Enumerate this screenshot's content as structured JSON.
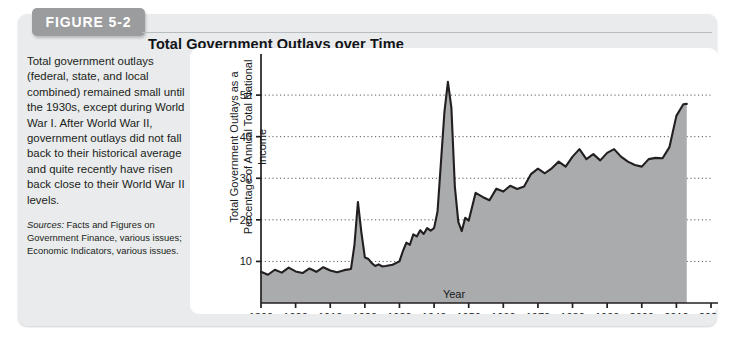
{
  "figure": {
    "tab_label": "FIGURE 5-2",
    "title": "Total Government Outlays over Time",
    "caption": "Total government outlays (federal, state, and local combined) remained small until the 1930s, except during World War I. After World War II, government outlays did not fall back to their historical average and quite recently have risen back close to their World War II levels.",
    "sources_label": "Sources:",
    "sources_text": " Facts and Figures on Government Finance, various issues; Economic Indicators, various issues."
  },
  "colors": {
    "card_background": "#e9ebec",
    "tab_background": "#9a9c9e",
    "panel_background": "#ffffff",
    "area_fill": "#a9abad",
    "line": "#231f20",
    "gridline": "#555759",
    "axis": "#231f20"
  },
  "chart_data": {
    "type": "area",
    "title": "Total Government Outlays over Time",
    "xlabel": "Year",
    "ylabel": "Total Government Outlays as a Percentage of Annual Total National Income",
    "xlim": [
      1890,
      2020
    ],
    "ylim": [
      0,
      57
    ],
    "xticks": [
      1890,
      1900,
      1910,
      1920,
      1930,
      1940,
      1950,
      1960,
      1970,
      1980,
      1990,
      2000,
      2010,
      2020
    ],
    "yticks": [
      10,
      20,
      30,
      40,
      50
    ],
    "grid": "horizontal-dotted",
    "legend": "none",
    "x": [
      1890,
      1892,
      1894,
      1896,
      1898,
      1900,
      1902,
      1904,
      1906,
      1908,
      1910,
      1912,
      1914,
      1916,
      1917,
      1918,
      1919,
      1920,
      1921,
      1922,
      1923,
      1924,
      1925,
      1926,
      1928,
      1930,
      1931,
      1932,
      1933,
      1934,
      1935,
      1936,
      1937,
      1938,
      1939,
      1940,
      1941,
      1942,
      1943,
      1944,
      1945,
      1946,
      1947,
      1948,
      1949,
      1950,
      1952,
      1954,
      1956,
      1958,
      1960,
      1962,
      1964,
      1966,
      1968,
      1970,
      1972,
      1974,
      1976,
      1978,
      1980,
      1982,
      1984,
      1986,
      1988,
      1990,
      1992,
      1994,
      1996,
      1998,
      2000,
      2002,
      2004,
      2006,
      2008,
      2010,
      2012,
      2013
    ],
    "values": [
      7.5,
      6.8,
      8.0,
      7.3,
      8.5,
      7.6,
      7.2,
      8.3,
      7.5,
      8.6,
      7.8,
      7.4,
      7.9,
      8.2,
      14.0,
      24.3,
      17.0,
      11.0,
      10.6,
      9.6,
      8.9,
      9.3,
      8.8,
      8.9,
      9.2,
      10.0,
      12.5,
      14.5,
      14.0,
      16.5,
      16.0,
      17.5,
      16.6,
      18.0,
      17.4,
      18.0,
      22.0,
      34.0,
      46.0,
      53.2,
      47.0,
      28.0,
      19.5,
      17.3,
      20.5,
      19.8,
      26.5,
      25.5,
      24.7,
      27.5,
      26.8,
      28.2,
      27.4,
      28.0,
      31.0,
      32.3,
      31.2,
      32.4,
      34.0,
      32.8,
      35.2,
      37.0,
      34.6,
      35.8,
      34.3,
      36.1,
      37.0,
      35.2,
      34.0,
      33.2,
      32.8,
      34.6,
      34.9,
      34.8,
      37.5,
      45.0,
      47.8,
      47.9
    ],
    "series_note": "Total government outlays as a percentage of annual total national income, 1890-2013"
  }
}
